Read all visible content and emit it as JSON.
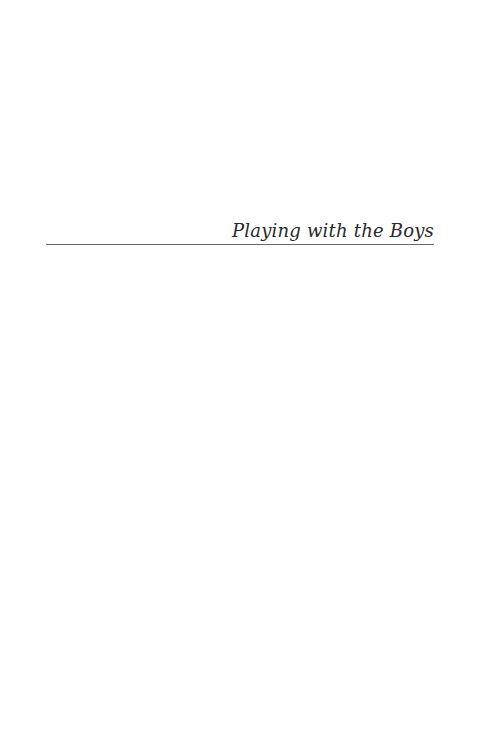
{
  "page": {
    "type": "half-title page",
    "title": "Playing with the Boys",
    "background_color": "#ffffff",
    "text_color": "#2a2a2a",
    "rule_color": "#6a6a6a"
  }
}
